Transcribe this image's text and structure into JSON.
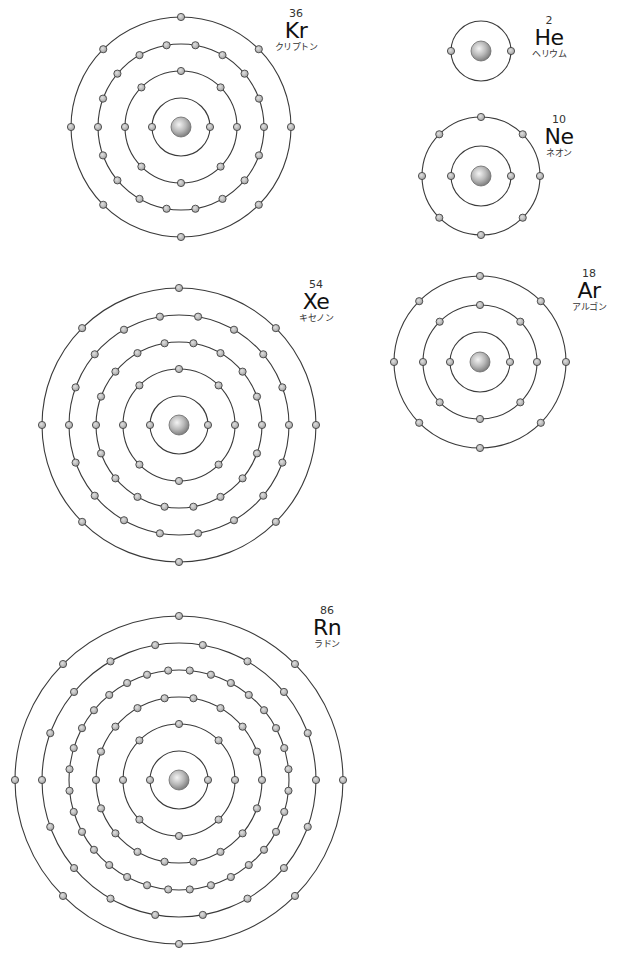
{
  "diagram": {
    "type": "bohr-model-noble-gases",
    "style": {
      "background": "#ffffff",
      "orbit_color": "#3a3a3a",
      "electron_fill": "#b5b5b5",
      "electron_stroke": "#444444",
      "nucleus_light": "#f0f0f0",
      "nucleus_dark": "#8a8a8a"
    },
    "atoms": [
      {
        "id": "kr",
        "symbol": "Kr",
        "atomic_number": "36",
        "name_ja": "クリプトン",
        "center": [
          181,
          127
        ],
        "shells": [
          {
            "radius": 29,
            "electrons": 2
          },
          {
            "radius": 56,
            "electrons": 8
          },
          {
            "radius": 83,
            "electrons": 18
          },
          {
            "radius": 110,
            "electrons": 8
          }
        ],
        "label_pos": [
          296,
          8
        ]
      },
      {
        "id": "he",
        "symbol": "He",
        "atomic_number": "2",
        "name_ja": "ヘリウム",
        "center": [
          481,
          51
        ],
        "shells": [
          {
            "radius": 30,
            "electrons": 2
          }
        ],
        "label_pos": [
          549,
          15
        ]
      },
      {
        "id": "ne",
        "symbol": "Ne",
        "atomic_number": "10",
        "name_ja": "ネオン",
        "center": [
          481,
          176
        ],
        "shells": [
          {
            "radius": 30,
            "electrons": 2
          },
          {
            "radius": 59,
            "electrons": 8
          }
        ],
        "label_pos": [
          559,
          114
        ]
      },
      {
        "id": "ar",
        "symbol": "Ar",
        "atomic_number": "18",
        "name_ja": "アルゴン",
        "center": [
          480,
          362
        ],
        "shells": [
          {
            "radius": 30,
            "electrons": 2
          },
          {
            "radius": 57,
            "electrons": 8
          },
          {
            "radius": 86,
            "electrons": 8
          }
        ],
        "label_pos": [
          589,
          268
        ]
      },
      {
        "id": "xe",
        "symbol": "Xe",
        "atomic_number": "54",
        "name_ja": "キセノン",
        "center": [
          179,
          425
        ],
        "shells": [
          {
            "radius": 29,
            "electrons": 2
          },
          {
            "radius": 56,
            "electrons": 8
          },
          {
            "radius": 83,
            "electrons": 18
          },
          {
            "radius": 110,
            "electrons": 18
          },
          {
            "radius": 137,
            "electrons": 8
          }
        ],
        "label_pos": [
          316,
          279
        ]
      },
      {
        "id": "rn",
        "symbol": "Rn",
        "atomic_number": "86",
        "name_ja": "ラドン",
        "center": [
          179,
          780
        ],
        "shells": [
          {
            "radius": 29,
            "electrons": 2
          },
          {
            "radius": 56,
            "electrons": 8
          },
          {
            "radius": 83,
            "electrons": 18
          },
          {
            "radius": 110,
            "electrons": 32
          },
          {
            "radius": 137,
            "electrons": 18
          },
          {
            "radius": 164,
            "electrons": 8
          }
        ],
        "label_pos": [
          327,
          605
        ]
      }
    ]
  }
}
